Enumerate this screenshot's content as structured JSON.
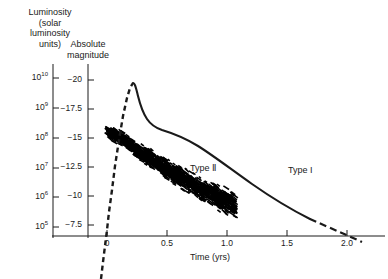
{
  "figure": {
    "background": "#ffffff",
    "ink": "#1a1a1a"
  },
  "axes": {
    "luminosity": {
      "title": "Luminosity\n(solar\nluminosity\nunits)",
      "ticks": [
        {
          "label": "10",
          "exponent": "10",
          "y": 78
        },
        {
          "label": "10",
          "exponent": "9",
          "y": 108
        },
        {
          "label": "10",
          "exponent": "8",
          "y": 138
        },
        {
          "label": "10",
          "exponent": "7",
          "y": 168
        },
        {
          "label": "10",
          "exponent": "6",
          "y": 197
        },
        {
          "label": "10",
          "exponent": "5",
          "y": 227
        }
      ]
    },
    "magnitude": {
      "title": "Absolute\nmagnitude",
      "ticks": [
        {
          "label": "−20",
          "y": 80
        },
        {
          "label": "−17.5",
          "y": 109
        },
        {
          "label": "−15",
          "y": 138
        },
        {
          "label": "−12.5",
          "y": 167
        },
        {
          "label": "−10",
          "y": 196
        },
        {
          "label": "−7.5",
          "y": 225
        }
      ]
    },
    "time": {
      "title": "Time (yrs)",
      "ticks": [
        {
          "label": "0",
          "x": 107
        },
        {
          "label": "0.5",
          "x": 167
        },
        {
          "label": "1.0",
          "x": 227
        },
        {
          "label": "1.5",
          "x": 287
        },
        {
          "label": "2.0",
          "x": 347
        }
      ]
    }
  },
  "annotations": {
    "type_i": "Type I",
    "type_ii": "Type Ⅱ"
  },
  "chart_data": {
    "type": "line",
    "title": "",
    "xlabel": "Time (yrs)",
    "ylabel": "Luminosity (solar luminosity units) / Absolute magnitude",
    "xlim": [
      -0.1,
      2.35
    ],
    "ylim_luminosity": [
      100000,
      10000000000
    ],
    "ylim_magnitude": [
      -7.5,
      -20
    ],
    "grid": false,
    "legend": "inline-annotations",
    "series": [
      {
        "name": "Type I",
        "style": "solid-with-dashed-rise-and-tail",
        "points": [
          {
            "t": -0.07,
            "mag": -5.5
          },
          {
            "t": -0.02,
            "mag": -9.5
          },
          {
            "t": 0.02,
            "mag": -13.5
          },
          {
            "t": 0.06,
            "mag": -16.5
          },
          {
            "t": 0.11,
            "mag": -18.6
          },
          {
            "t": 0.17,
            "mag": -19.6
          },
          {
            "t": 0.22,
            "mag": -19.9
          },
          {
            "t": 0.26,
            "mag": -19.4
          },
          {
            "t": 0.33,
            "mag": -18.2
          },
          {
            "t": 0.42,
            "mag": -17.2
          },
          {
            "t": 0.55,
            "mag": -16.6
          },
          {
            "t": 0.75,
            "mag": -15.7
          },
          {
            "t": 1.0,
            "mag": -14.6
          },
          {
            "t": 1.3,
            "mag": -13.3
          },
          {
            "t": 1.6,
            "mag": -12.0
          },
          {
            "t": 1.9,
            "mag": -10.6
          },
          {
            "t": 2.1,
            "mag": -9.7
          },
          {
            "t": 2.3,
            "mag": -8.7
          }
        ]
      },
      {
        "name": "Type Ⅱ",
        "style": "dashed-scatter-band",
        "band_center": [
          {
            "t": 0.0,
            "mag": -15.6
          },
          {
            "t": 0.12,
            "mag": -15.0
          },
          {
            "t": 0.3,
            "mag": -13.6
          },
          {
            "t": 0.5,
            "mag": -12.3
          },
          {
            "t": 0.7,
            "mag": -11.1
          },
          {
            "t": 0.9,
            "mag": -10.0
          },
          {
            "t": 1.05,
            "mag": -9.2
          }
        ],
        "band_half_width_mag": 1.5,
        "t_range": [
          0.0,
          1.08
        ]
      }
    ]
  }
}
